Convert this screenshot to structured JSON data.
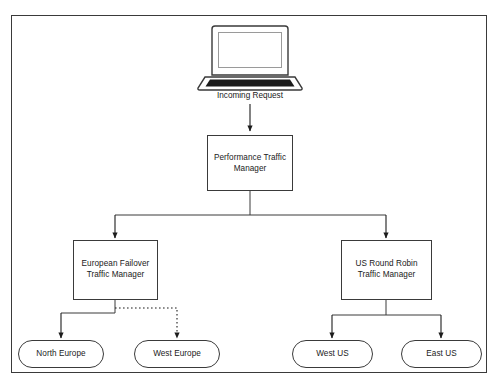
{
  "diagram": {
    "background_color": "#ffffff",
    "border_color": "#3a3a3a",
    "stroke_color": "#3a3a3a",
    "text_color": "#1a1a1a",
    "client": {
      "icon": "laptop-icon",
      "screen_color": "#ffffff",
      "keyboard_color": "#1c1c1c"
    },
    "edges": {
      "incoming_request_label": "Incoming Request",
      "european_failover_style": "dotted"
    },
    "nodes": {
      "performance": {
        "label": "Performance Traffic\nManager",
        "shape": "rectangle"
      },
      "european_failover": {
        "label": "European Failover\nTraffic Manager",
        "shape": "rectangle"
      },
      "us_round_robin": {
        "label": "US Round Robin\nTraffic Manager",
        "shape": "rectangle"
      },
      "north_europe": {
        "label": "North Europe",
        "shape": "stadium"
      },
      "west_europe": {
        "label": "West Europe",
        "shape": "stadium"
      },
      "west_us": {
        "label": "West US",
        "shape": "stadium"
      },
      "east_us": {
        "label": "East US",
        "shape": "stadium"
      }
    }
  }
}
